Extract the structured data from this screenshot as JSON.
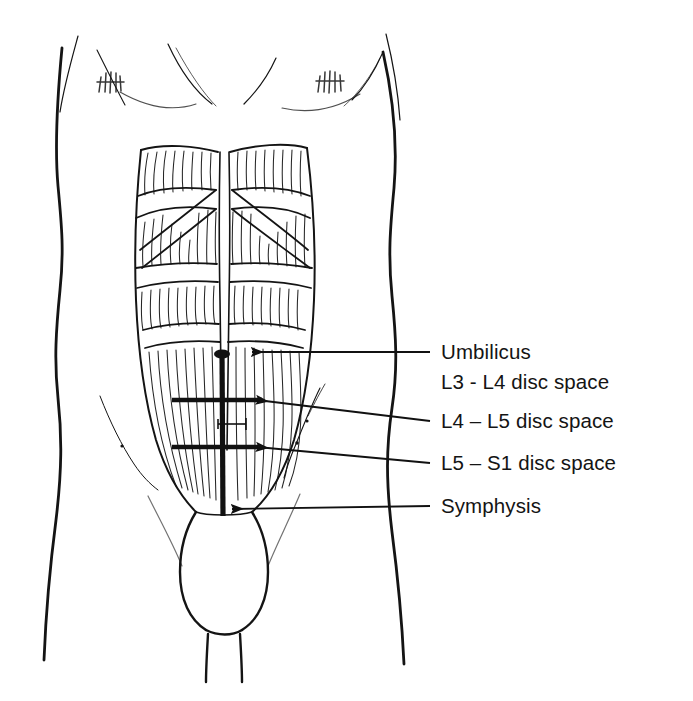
{
  "figure": {
    "style": "black ink line drawing on white",
    "colors": {
      "ink": "#111111",
      "background": "#ffffff",
      "hatch": "#333333"
    }
  },
  "labels": [
    {
      "id": "umbilicus",
      "text": "Umbilicus",
      "x": 441,
      "y": 340
    },
    {
      "id": "l3-l4",
      "text": "L3 - L4 disc space",
      "x": 441,
      "y": 370
    },
    {
      "id": "l4-l5",
      "text": "L4 – L5 disc space",
      "x": 441,
      "y": 409
    },
    {
      "id": "l5-s1",
      "text": "L5 – S1 disc space",
      "x": 441,
      "y": 451
    },
    {
      "id": "symphysis",
      "text": "Symphysis",
      "x": 441,
      "y": 494
    }
  ],
  "leaders": [
    {
      "id": "leader-umbilicus",
      "x1": 430,
      "y1": 352,
      "x2": 252,
      "y2": 352,
      "arrow": true
    },
    {
      "id": "leader-l4-l5",
      "x1": 430,
      "y1": 421,
      "x2": 257,
      "y2": 400,
      "arrow": true
    },
    {
      "id": "leader-l5-s1",
      "x1": 430,
      "y1": 463,
      "x2": 257,
      "y2": 447,
      "arrow": true
    },
    {
      "id": "leader-symphysis",
      "x1": 430,
      "y1": 506,
      "x2": 232,
      "y2": 509,
      "arrow": true
    }
  ],
  "markings": {
    "midline_incision": {
      "x": 222,
      "y_top": 352,
      "y_bottom": 516
    },
    "crossbar_l4_l5": {
      "y": 400,
      "x1": 172,
      "x2": 262
    },
    "crossbar_l5_s1": {
      "y": 447,
      "x1": 172,
      "x2": 258
    },
    "small_tick": {
      "y": 424,
      "x1": 218,
      "x2": 246
    }
  },
  "icon_names": [
    "torso-outline",
    "rectus-abdominis-muscle",
    "tendinous-intersection",
    "linea-alba",
    "umbilicus-marker",
    "iliac-crest-line",
    "arrowhead-icon",
    "nipple-hatch-icon",
    "scrotum-outline",
    "thigh-outline"
  ]
}
